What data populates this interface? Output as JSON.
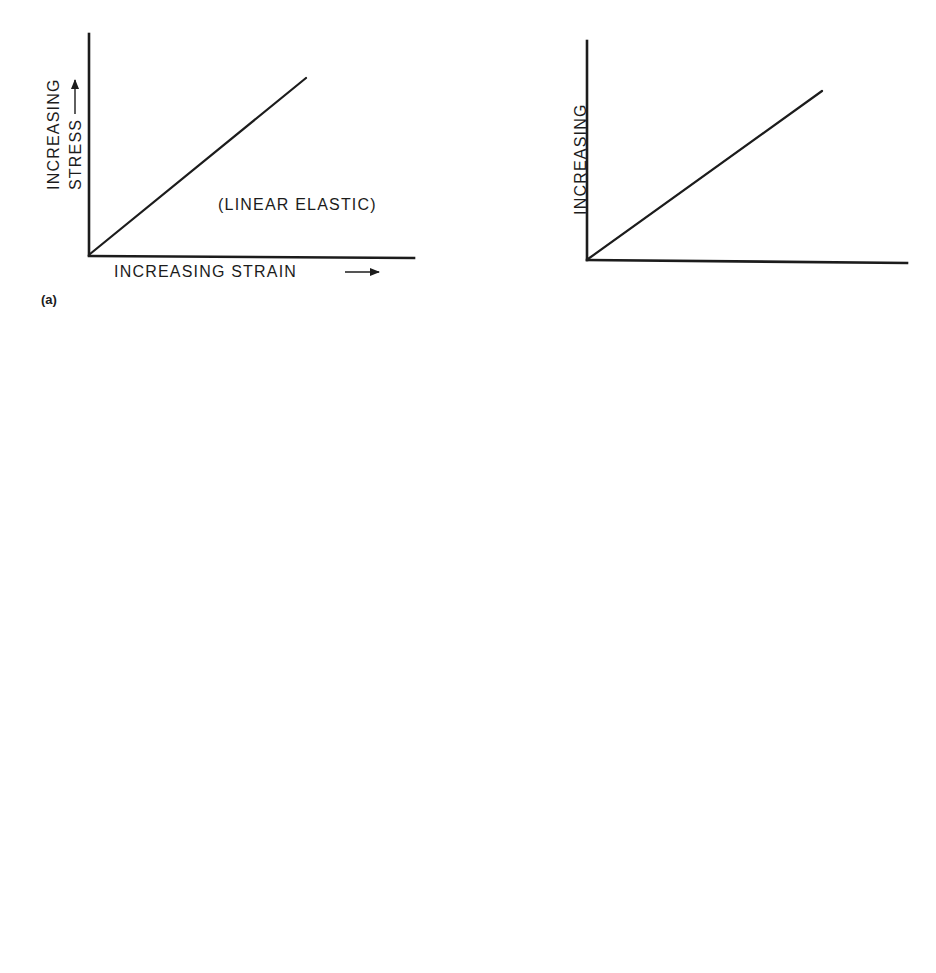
{
  "figure": {
    "colors": {
      "ink": "#1c1c1c",
      "background": "#ffffff"
    },
    "panels": [
      {
        "id": "a",
        "label": "(a)",
        "y_axis_line1": "INCREASING",
        "y_axis_line2": "STRESS",
        "x_axis": "INCREASING STRAIN",
        "annotations": [
          "(LINEAR ELASTIC)"
        ]
      },
      {
        "id": "b",
        "label": "(b)",
        "y_axis_line1": "INCREASING",
        "y_axis_line2": "STRESS",
        "x_axis": "INCREASING STRAIN RATE",
        "annotations": []
      },
      {
        "id": "c",
        "label": "(c)",
        "y_axis_line1": "INCREASING",
        "y_axis_line2": "STRESS",
        "x_axis": "INCREASING STRAIN",
        "sigma": "σ",
        "sigma_sub": "o",
        "flow_stress": "FLOW STRESS",
        "annotations": [
          "(PLASTIC)",
          "(ELASTIC)"
        ]
      },
      {
        "id": "d",
        "label": "(d)",
        "y_axis_line1": "INCREASING",
        "y_axis_line2": "STRESS",
        "x_axis": "INCREASING STRAIN",
        "sigma": "σ",
        "sigma_sub": "o",
        "flow_stress": "FLOW STRESS",
        "annotations": [
          "(PLASTIC)",
          "(RIGID)"
        ]
      },
      {
        "id": "e",
        "label": "(e)",
        "y_axis_line1": "INCREASING",
        "y_axis_line2": "STRESS",
        "x_axis": "INCREASING STRAIN",
        "sigma": "σ",
        "sigma_sub": "o",
        "flow_stress_line1": "FLOW",
        "flow_stress_line2": "STRESS",
        "annotations": {
          "idealized_line1": "IDEALIZED",
          "idealized_line2": "(LINEAR)",
          "actual_line1": "ACTUAL",
          "actual_line2": "BEHAVIOR",
          "elastic": "(ELASTIC)"
        }
      }
    ]
  }
}
